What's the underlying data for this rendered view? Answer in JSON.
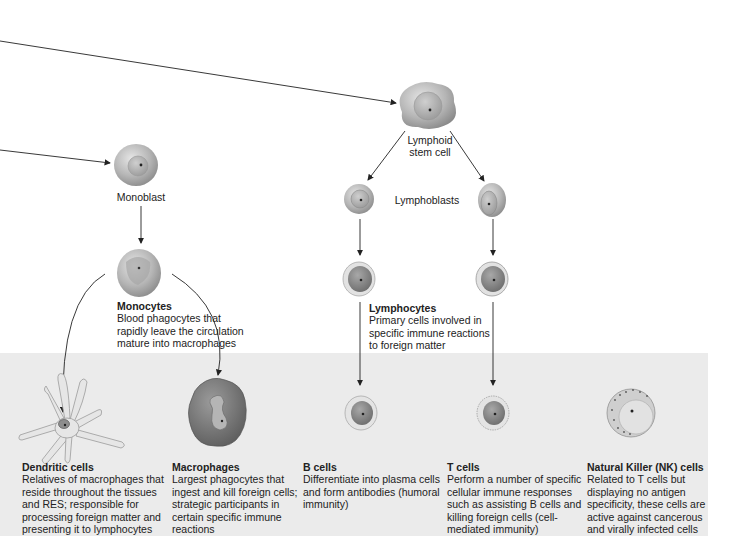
{
  "diagram": {
    "stage_labels": {
      "monoblast": "Monoblast",
      "lymphoid_stem_cell_line1": "Lymphoid",
      "lymphoid_stem_cell_line2": "stem cell",
      "lymphoblasts": "Lymphoblasts"
    },
    "intermediate": {
      "monocytes": {
        "title": "Monocytes",
        "body": "Blood phagocytes that\nrapidly leave the circulation\nmature into macrophages"
      },
      "lymphocytes": {
        "title": "Lymphocytes",
        "body": "Primary cells involved in\nspecific immune reactions\nto foreign matter"
      }
    },
    "mature_cells": [
      {
        "title": "Dendritic cells",
        "body": "Relatives of macrophages that\nreside throughout the tissues\nand RES; responsible for\nprocessing foreign matter and\npresenting it to lymphocytes"
      },
      {
        "title": "Macrophages",
        "body": "Largest phagocytes that\ningest and kill foreign cells;\nstrategic participants in\ncertain specific immune\nreactions"
      },
      {
        "title": "B cells",
        "body": "Differentiate into plasma cells\nand form antibodies (humoral\nimmunity)"
      },
      {
        "title": "T cells",
        "body": "Perform a number of specific\ncellular immune responses\nsuch as assisting B cells and\nkilling foreign cells (cell-\nmediated immunity)"
      },
      {
        "title": "Natural Killer (NK) cells",
        "body": "Related to T cells but\ndisplaying no antigen\nspecificity, these cells are\nactive against cancerous\nand virally infected cells"
      }
    ],
    "colors": {
      "band": "#ebebeb",
      "arrow": "#222222",
      "cell_light": "#d8d8d8",
      "cell_dark": "#8a8a8a"
    }
  }
}
